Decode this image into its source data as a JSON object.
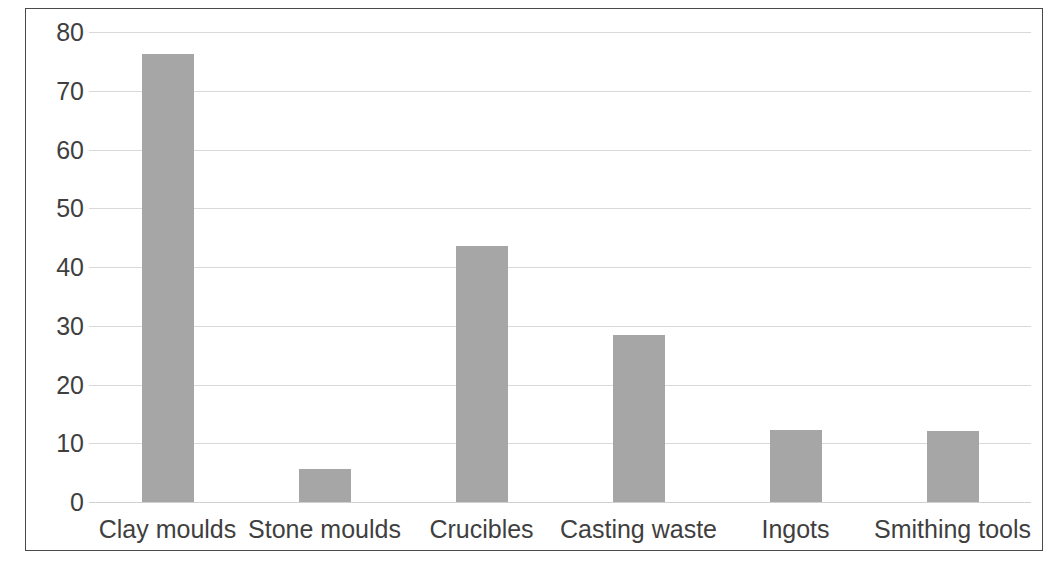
{
  "chart_data": {
    "type": "bar",
    "title": "",
    "subtitle": "",
    "xlabel": "",
    "ylabel": "",
    "categories": [
      "Clay moulds",
      "Stone moulds",
      "Crucibles",
      "Casting waste",
      "Ingots",
      "Smithing tools"
    ],
    "values": [
      76.3,
      5.6,
      43.6,
      28.4,
      12.3,
      12.1
    ],
    "ylim": [
      0,
      80
    ],
    "ytick_labels": [
      "80",
      "70",
      "60",
      "50",
      "40",
      "30",
      "20",
      "10",
      "0"
    ],
    "ytick_values": [
      80,
      70,
      60,
      50,
      40,
      30,
      20,
      10,
      0
    ],
    "grid": true,
    "legend": false,
    "legend_position": "none",
    "bar_color": "#a6a6a6",
    "gridline_color": "#d9d9d9",
    "frame_color": "#4a4a4a",
    "text_color": "#3f3f3f",
    "background_color": "#ffffff"
  }
}
